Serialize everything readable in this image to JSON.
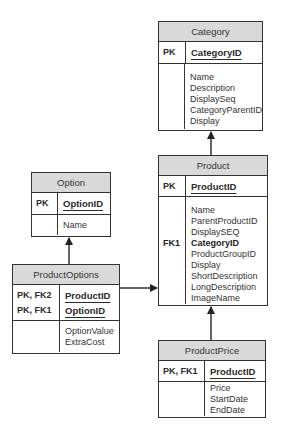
{
  "diagram": {
    "type": "entity-relationship",
    "entities": [
      {
        "name": "Category",
        "primary_keys": [
          {
            "key": "PK",
            "field": "CategoryID"
          }
        ],
        "attributes": [
          {
            "key": "",
            "field": "Name"
          },
          {
            "key": "",
            "field": "Description"
          },
          {
            "key": "",
            "field": "DisplaySeq"
          },
          {
            "key": "",
            "field": "CategoryParentID"
          },
          {
            "key": "",
            "field": "Display"
          }
        ]
      },
      {
        "name": "Product",
        "primary_keys": [
          {
            "key": "PK",
            "field": "ProductID"
          }
        ],
        "attributes": [
          {
            "key": "",
            "field": "Name"
          },
          {
            "key": "",
            "field": "ParentProductID"
          },
          {
            "key": "",
            "field": "DisplaySEQ"
          },
          {
            "key": "FK1",
            "field": "CategoryID"
          },
          {
            "key": "",
            "field": "ProductGroupID"
          },
          {
            "key": "",
            "field": "Display"
          },
          {
            "key": "",
            "field": "ShortDescription"
          },
          {
            "key": "",
            "field": "LongDescription"
          },
          {
            "key": "",
            "field": "ImageName"
          }
        ]
      },
      {
        "name": "Option",
        "primary_keys": [
          {
            "key": "PK",
            "field": "OptionID"
          }
        ],
        "attributes": [
          {
            "key": "",
            "field": "Name"
          }
        ]
      },
      {
        "name": "ProductOptions",
        "primary_keys": [
          {
            "key": "PK, FK2",
            "field": "ProductID"
          },
          {
            "key": "PK, FK1",
            "field": "OptionID"
          }
        ],
        "attributes": [
          {
            "key": "",
            "field": "OptionValue"
          },
          {
            "key": "",
            "field": "ExtraCost"
          }
        ]
      },
      {
        "name": "ProductPrice",
        "primary_keys": [
          {
            "key": "PK, FK1",
            "field": "ProductID"
          }
        ],
        "attributes": [
          {
            "key": "",
            "field": "Price"
          },
          {
            "key": "",
            "field": "StartDate"
          },
          {
            "key": "",
            "field": "EndDate"
          }
        ]
      }
    ],
    "relationships": [
      {
        "from": "Product",
        "to": "Category"
      },
      {
        "from": "ProductPrice",
        "to": "Product"
      },
      {
        "from": "ProductOptions",
        "to": "Option"
      },
      {
        "from": "ProductOptions",
        "to": "Product"
      }
    ],
    "colors": {
      "header_fill": "#d9d9d9",
      "border": "#333333",
      "background": "#ffffff"
    }
  }
}
